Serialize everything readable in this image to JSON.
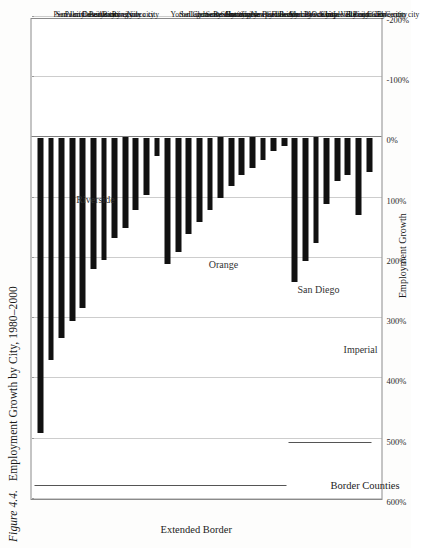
{
  "figure": {
    "number": "Figure 4.4.",
    "title": "Employment Growth by City, 1980–2000"
  },
  "axis": {
    "label": "Employment Growth",
    "ticks": [
      "600%",
      "500%",
      "400%",
      "300%",
      "200%",
      "100%",
      "0%",
      "-100%",
      "-200%"
    ],
    "min": -200,
    "max": 600
  },
  "brackets": [
    {
      "label": "Extended Border"
    },
    {
      "label": "Border Counties"
    }
  ],
  "counties": [
    {
      "label": "Riverside"
    },
    {
      "label": "Orange"
    },
    {
      "label": "San Diego"
    },
    {
      "label": "Imperial"
    }
  ],
  "chart_data": {
    "type": "bar",
    "title": "Employment Growth by City, 1980–2000",
    "xlabel": "",
    "ylabel": "Employment Growth",
    "orientation": "horizontal",
    "xlim": [
      -200,
      600
    ],
    "grid": true,
    "legend": "none",
    "categories": [
      "Perris city",
      "San Jacinto city",
      "Palm Desert city",
      "Cahuilla city",
      "Beaumont city",
      "Banning city",
      "Riverside city",
      "Norco city",
      "Yorba Linda city",
      "San Clemente city",
      "Laguna Beach city",
      "Santa Ana city",
      "Stanton city",
      "Costa mesa city",
      "Huntington Beach city",
      "Garden Grove city",
      "Newport Beach city",
      "Fullerton city",
      "Los Alamitos city",
      "Seal Beach city",
      "Vista city",
      "Oceanside city",
      "Chula Vista city",
      "Imperial Beach city",
      "El Cajon city",
      "Lemon Grove city",
      "Calexico city",
      "El Centro city"
    ],
    "values": [
      490,
      370,
      333,
      305,
      283,
      218,
      204,
      167,
      155,
      148,
      133,
      122,
      117,
      110,
      100,
      92,
      86,
      80,
      72,
      62,
      52,
      40,
      30,
      22,
      17,
      12,
      8,
      5
    ],
    "groups": [
      {
        "name": "Riverside",
        "from": 0,
        "to": 7
      },
      {
        "name": "Orange",
        "from": 8,
        "to": 19
      },
      {
        "name": "San Diego",
        "from": 20,
        "to": 25
      },
      {
        "name": "Imperial",
        "from": 26,
        "to": 27
      }
    ],
    "bars": [
      {
        "label": "Perris city",
        "value": 490,
        "county": "Riverside"
      },
      {
        "label": "San Jacinto city",
        "value": 370,
        "county": "Riverside"
      },
      {
        "label": "Palm Desert city",
        "value": 333,
        "county": "Riverside"
      },
      {
        "label": "Cahuilla city",
        "value": 305,
        "county": "Riverside"
      },
      {
        "label": "Beaumont city",
        "value": 283,
        "county": "Riverside"
      },
      {
        "label": "Banning city",
        "value": 218,
        "county": "Riverside"
      },
      {
        "label": "Riverside city",
        "value": 204,
        "county": "Riverside"
      },
      {
        "label": "Norco city",
        "value": 167,
        "county": "Riverside"
      },
      {
        "label": "",
        "value": 150,
        "county": "Riverside"
      },
      {
        "label": "",
        "value": 120,
        "county": "Riverside"
      },
      {
        "label": "",
        "value": 95,
        "county": "Riverside"
      },
      {
        "label": "",
        "value": 30,
        "county": "Riverside"
      },
      {
        "label": "Yorba Linda city",
        "value": 210,
        "county": "Orange"
      },
      {
        "label": "San Clemente city",
        "value": 190,
        "county": "Orange"
      },
      {
        "label": "Laguna Beach city",
        "value": 160,
        "county": "Orange"
      },
      {
        "label": "Santa Ana city",
        "value": 140,
        "county": "Orange"
      },
      {
        "label": "Stanton city",
        "value": 120,
        "county": "Orange"
      },
      {
        "label": "Costa mesa city",
        "value": 100,
        "county": "Orange"
      },
      {
        "label": "Huntington Beach city",
        "value": 80,
        "county": "Orange"
      },
      {
        "label": "Garden Grove city",
        "value": 62,
        "county": "Orange"
      },
      {
        "label": "Newport Beach city",
        "value": 50,
        "county": "Orange"
      },
      {
        "label": "Fullerton city",
        "value": 38,
        "county": "Orange"
      },
      {
        "label": "Los Alamitos city",
        "value": 22,
        "county": "Orange"
      },
      {
        "label": "Seal Beach city",
        "value": 14,
        "county": "Orange"
      },
      {
        "label": "Vista city",
        "value": 240,
        "county": "San Diego"
      },
      {
        "label": "Oceanside city",
        "value": 205,
        "county": "San Diego"
      },
      {
        "label": "Chula Vista city",
        "value": 175,
        "county": "San Diego"
      },
      {
        "label": "Imperial Beach city",
        "value": 110,
        "county": "San Diego"
      },
      {
        "label": "El Cajon city",
        "value": 72,
        "county": "San Diego"
      },
      {
        "label": "Lemon Grove city",
        "value": 62,
        "county": "San Diego"
      },
      {
        "label": "Calexico city",
        "value": 128,
        "county": "Imperial"
      },
      {
        "label": "El Centro city",
        "value": 58,
        "county": "Imperial"
      }
    ]
  }
}
